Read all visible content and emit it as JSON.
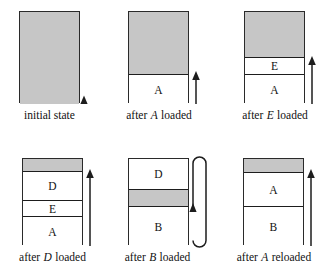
{
  "figure": {
    "colors": {
      "free_memory": "#c6c6c6",
      "occupied_memory": "#ffffff",
      "ink": "#1d1d1d",
      "page_background": "#ffffff"
    },
    "panels": [
      {
        "id": "initial-state",
        "caption_prefix": "initial state",
        "caption_emph": "",
        "caption_suffix": "",
        "box": {
          "x": 19,
          "y": 11,
          "w": 61,
          "h": 92
        },
        "segments": [
          {
            "label": "",
            "kind": "free",
            "top": 0,
            "height": 92,
            "rule_top": false
          }
        ],
        "arrow": null,
        "marker": {
          "type": "triangle-up",
          "x": 84,
          "y": 103
        },
        "loop": null,
        "caption": {
          "x": 0,
          "y": 109,
          "w": 100
        }
      },
      {
        "id": "after-a-loaded",
        "caption_prefix": "after ",
        "caption_emph": "A",
        "caption_suffix": " loaded",
        "box": {
          "x": 128,
          "y": 11,
          "w": 61,
          "h": 92
        },
        "segments": [
          {
            "label": "",
            "kind": "free",
            "top": 0,
            "height": 62,
            "rule_top": false
          },
          {
            "label": "A",
            "kind": "used",
            "top": 62,
            "height": 30,
            "rule_top": true
          }
        ],
        "arrow": {
          "x": 196,
          "y_top": 72,
          "y_bottom": 103
        },
        "marker": null,
        "loop": null,
        "caption": {
          "x": 109,
          "y": 109,
          "w": 100
        }
      },
      {
        "id": "after-e-loaded",
        "caption_prefix": "after ",
        "caption_emph": "E",
        "caption_suffix": " loaded",
        "box": {
          "x": 244,
          "y": 11,
          "w": 61,
          "h": 92
        },
        "segments": [
          {
            "label": "",
            "kind": "free",
            "top": 0,
            "height": 45,
            "rule_top": false
          },
          {
            "label": "E",
            "kind": "used",
            "top": 45,
            "height": 17,
            "rule_top": true
          },
          {
            "label": "A",
            "kind": "used",
            "top": 62,
            "height": 30,
            "rule_top": true
          }
        ],
        "arrow": {
          "x": 312,
          "y_top": 57,
          "y_bottom": 103
        },
        "marker": null,
        "loop": null,
        "caption": {
          "x": 222,
          "y": 109,
          "w": 106
        }
      },
      {
        "id": "after-d-loaded",
        "caption_prefix": "after ",
        "caption_emph": "D",
        "caption_suffix": " loaded",
        "box": {
          "x": 22,
          "y": 158,
          "w": 61,
          "h": 87
        },
        "segments": [
          {
            "label": "",
            "kind": "free",
            "top": 0,
            "height": 12,
            "rule_top": false
          },
          {
            "label": "D",
            "kind": "used",
            "top": 12,
            "height": 29,
            "rule_top": true
          },
          {
            "label": "E",
            "kind": "used",
            "top": 41,
            "height": 16,
            "rule_top": true
          },
          {
            "label": "A",
            "kind": "used",
            "top": 57,
            "height": 30,
            "rule_top": true
          }
        ],
        "arrow": {
          "x": 90,
          "y_top": 170,
          "y_bottom": 245
        },
        "marker": null,
        "loop": null,
        "caption": {
          "x": 0,
          "y": 251,
          "w": 105
        }
      },
      {
        "id": "after-b-loaded",
        "caption_prefix": "after ",
        "caption_emph": "B",
        "caption_suffix": " loaded",
        "box": {
          "x": 128,
          "y": 158,
          "w": 61,
          "h": 87
        },
        "segments": [
          {
            "label": "D",
            "kind": "used",
            "top": 0,
            "height": 30,
            "rule_top": false
          },
          {
            "label": "",
            "kind": "free",
            "top": 30,
            "height": 17,
            "rule_top": true
          },
          {
            "label": "B",
            "kind": "used",
            "top": 47,
            "height": 40,
            "rule_top": true
          }
        ],
        "arrow": null,
        "marker": null,
        "loop": {
          "x_left": 193,
          "x_right": 206,
          "y_top": 157,
          "y_bottom": 247,
          "arrow_y": 203
        },
        "caption": {
          "x": 105,
          "y": 251,
          "w": 105
        }
      },
      {
        "id": "after-a-reloaded",
        "caption_prefix": "after ",
        "caption_emph": "A",
        "caption_suffix": " reloaded",
        "box": {
          "x": 243,
          "y": 158,
          "w": 61,
          "h": 87
        },
        "segments": [
          {
            "label": "",
            "kind": "free",
            "top": 0,
            "height": 13,
            "rule_top": false
          },
          {
            "label": "A",
            "kind": "used",
            "top": 13,
            "height": 34,
            "rule_top": true
          },
          {
            "label": "B",
            "kind": "used",
            "top": 47,
            "height": 40,
            "rule_top": true
          }
        ],
        "arrow": {
          "x": 311,
          "y_top": 170,
          "y_bottom": 245
        },
        "marker": null,
        "loop": null,
        "caption": {
          "x": 218,
          "y": 251,
          "w": 112
        }
      }
    ]
  }
}
